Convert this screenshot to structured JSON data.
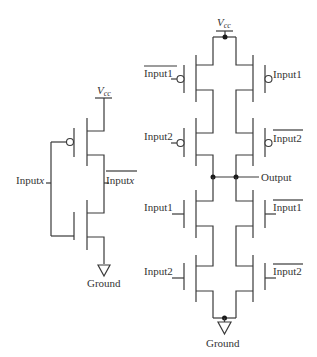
{
  "inverter": {
    "vcc_label": "V",
    "vcc_sub": "cc",
    "input_label": "Input",
    "input_var": "x",
    "output_label": "Input",
    "output_var": "x",
    "output_overline": true,
    "ground_label": "Ground"
  },
  "xor_gate": {
    "vcc_label": "V",
    "vcc_sub": "cc",
    "output_label": "Output",
    "ground_label": "Ground",
    "pmos_left": [
      {
        "label": "Input1",
        "inverted": true
      },
      {
        "label": "Input2",
        "inverted": false
      }
    ],
    "pmos_right": [
      {
        "label": "Input1",
        "inverted": false
      },
      {
        "label": "Input2",
        "inverted": true
      }
    ],
    "nmos_left": [
      {
        "label": "Input1",
        "inverted": false
      },
      {
        "label": "Input2",
        "inverted": false
      }
    ],
    "nmos_right": [
      {
        "label": "Input1",
        "inverted": true
      },
      {
        "label": "Input2",
        "inverted": true
      }
    ]
  },
  "colors": {
    "wire": "#3a3a3a",
    "background": "#ffffff"
  }
}
